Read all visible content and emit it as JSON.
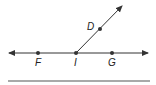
{
  "diagram": {
    "type": "geometry-lines-and-rays",
    "points": [
      {
        "id": "F",
        "label": "F",
        "on": "line FG"
      },
      {
        "id": "I",
        "label": "I",
        "on": "line FG",
        "role": "ray endpoint"
      },
      {
        "id": "G",
        "label": "G",
        "on": "line FG"
      },
      {
        "id": "D",
        "label": "D",
        "on": "ray ID"
      }
    ],
    "line": {
      "name": "line FG",
      "through": [
        "F",
        "I",
        "G"
      ],
      "arrows": "both"
    },
    "ray": {
      "name": "ray ID",
      "endpoint": "I",
      "through": "D",
      "arrows": "end"
    },
    "colors": {
      "stroke": "#333333",
      "point": "#333333",
      "text": "#222222"
    }
  }
}
